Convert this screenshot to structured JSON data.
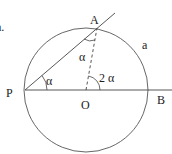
{
  "diagram": {
    "type": "circle-geometry",
    "labels": {
      "corner_text": "a.",
      "point_A": "A",
      "point_P": "P",
      "point_O": "O",
      "point_B": "B",
      "arc_a": "a",
      "angle_at_P": "α",
      "angle_at_A": "α",
      "angle_at_O": "2 α"
    },
    "colors": {
      "stroke": "#444444",
      "text": "#222222",
      "background": "#ffffff"
    }
  }
}
